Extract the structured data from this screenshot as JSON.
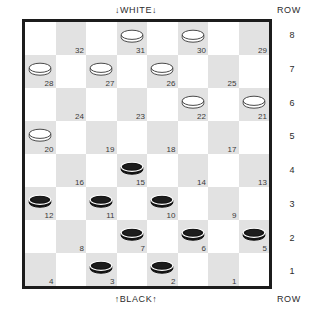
{
  "board": {
    "top_label": "↓WHITE↓",
    "bottom_label": "↑BLACK↑",
    "row_header_top": "ROW",
    "row_header_bottom": "ROW",
    "row_numbers": [
      "8",
      "7",
      "6",
      "5",
      "4",
      "3",
      "2",
      "1"
    ],
    "size": 8,
    "light_color": "#ffffff",
    "dark_color": "#e2e2e2",
    "border_color": "#1c1c1c",
    "white_piece_color": "#ffffff",
    "black_piece_color": "#141414",
    "rows": [
      {
        "row": "8",
        "squares": [
          {
            "num": "",
            "shade": "light",
            "piece": ""
          },
          {
            "num": "32",
            "shade": "dark",
            "piece": ""
          },
          {
            "num": "",
            "shade": "light",
            "piece": ""
          },
          {
            "num": "31",
            "shade": "dark",
            "piece": "white"
          },
          {
            "num": "",
            "shade": "light",
            "piece": ""
          },
          {
            "num": "30",
            "shade": "dark",
            "piece": "white"
          },
          {
            "num": "",
            "shade": "light",
            "piece": ""
          },
          {
            "num": "29",
            "shade": "dark",
            "piece": ""
          }
        ]
      },
      {
        "row": "7",
        "squares": [
          {
            "num": "28",
            "shade": "dark",
            "piece": "white"
          },
          {
            "num": "",
            "shade": "light",
            "piece": ""
          },
          {
            "num": "27",
            "shade": "dark",
            "piece": "white"
          },
          {
            "num": "",
            "shade": "light",
            "piece": ""
          },
          {
            "num": "26",
            "shade": "dark",
            "piece": "white"
          },
          {
            "num": "",
            "shade": "light",
            "piece": ""
          },
          {
            "num": "25",
            "shade": "dark",
            "piece": ""
          },
          {
            "num": "",
            "shade": "light",
            "piece": ""
          }
        ]
      },
      {
        "row": "6",
        "squares": [
          {
            "num": "",
            "shade": "light",
            "piece": ""
          },
          {
            "num": "24",
            "shade": "dark",
            "piece": ""
          },
          {
            "num": "",
            "shade": "light",
            "piece": ""
          },
          {
            "num": "23",
            "shade": "dark",
            "piece": ""
          },
          {
            "num": "",
            "shade": "light",
            "piece": ""
          },
          {
            "num": "22",
            "shade": "dark",
            "piece": "white"
          },
          {
            "num": "",
            "shade": "light",
            "piece": ""
          },
          {
            "num": "21",
            "shade": "dark",
            "piece": "white"
          }
        ]
      },
      {
        "row": "5",
        "squares": [
          {
            "num": "20",
            "shade": "dark",
            "piece": "white"
          },
          {
            "num": "",
            "shade": "light",
            "piece": ""
          },
          {
            "num": "19",
            "shade": "dark",
            "piece": ""
          },
          {
            "num": "",
            "shade": "light",
            "piece": ""
          },
          {
            "num": "18",
            "shade": "dark",
            "piece": ""
          },
          {
            "num": "",
            "shade": "light",
            "piece": ""
          },
          {
            "num": "17",
            "shade": "dark",
            "piece": ""
          },
          {
            "num": "",
            "shade": "light",
            "piece": ""
          }
        ]
      },
      {
        "row": "4",
        "squares": [
          {
            "num": "",
            "shade": "light",
            "piece": ""
          },
          {
            "num": "16",
            "shade": "dark",
            "piece": ""
          },
          {
            "num": "",
            "shade": "light",
            "piece": ""
          },
          {
            "num": "15",
            "shade": "dark",
            "piece": "black"
          },
          {
            "num": "",
            "shade": "light",
            "piece": ""
          },
          {
            "num": "14",
            "shade": "dark",
            "piece": ""
          },
          {
            "num": "",
            "shade": "light",
            "piece": ""
          },
          {
            "num": "13",
            "shade": "dark",
            "piece": ""
          }
        ]
      },
      {
        "row": "3",
        "squares": [
          {
            "num": "12",
            "shade": "dark",
            "piece": "black"
          },
          {
            "num": "",
            "shade": "light",
            "piece": ""
          },
          {
            "num": "11",
            "shade": "dark",
            "piece": "black"
          },
          {
            "num": "",
            "shade": "light",
            "piece": ""
          },
          {
            "num": "10",
            "shade": "dark",
            "piece": "black"
          },
          {
            "num": "",
            "shade": "light",
            "piece": ""
          },
          {
            "num": "9",
            "shade": "dark",
            "piece": ""
          },
          {
            "num": "",
            "shade": "light",
            "piece": ""
          }
        ]
      },
      {
        "row": "2",
        "squares": [
          {
            "num": "",
            "shade": "light",
            "piece": ""
          },
          {
            "num": "8",
            "shade": "dark",
            "piece": ""
          },
          {
            "num": "",
            "shade": "light",
            "piece": ""
          },
          {
            "num": "7",
            "shade": "dark",
            "piece": "black"
          },
          {
            "num": "",
            "shade": "light",
            "piece": ""
          },
          {
            "num": "6",
            "shade": "dark",
            "piece": "black"
          },
          {
            "num": "",
            "shade": "light",
            "piece": ""
          },
          {
            "num": "5",
            "shade": "dark",
            "piece": "black"
          }
        ]
      },
      {
        "row": "1",
        "squares": [
          {
            "num": "4",
            "shade": "dark",
            "piece": ""
          },
          {
            "num": "",
            "shade": "light",
            "piece": ""
          },
          {
            "num": "3",
            "shade": "dark",
            "piece": "black"
          },
          {
            "num": "",
            "shade": "light",
            "piece": ""
          },
          {
            "num": "2",
            "shade": "dark",
            "piece": "black"
          },
          {
            "num": "",
            "shade": "light",
            "piece": ""
          },
          {
            "num": "1",
            "shade": "dark",
            "piece": ""
          },
          {
            "num": "",
            "shade": "light",
            "piece": ""
          }
        ]
      }
    ]
  }
}
